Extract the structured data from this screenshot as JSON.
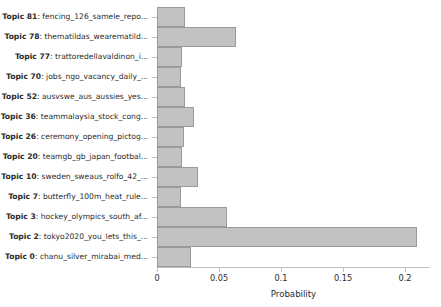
{
  "chart_data": {
    "type": "bar",
    "orientation": "horizontal",
    "title": "",
    "subtitle": "",
    "xlabel": "Probability",
    "ylabel": "",
    "xlim": [
      0,
      0.2215
    ],
    "ylim": null,
    "grid": false,
    "legend": null,
    "xticks": [
      0,
      0.05,
      0.1,
      0.15,
      0.2
    ],
    "xticklabels": [
      "0",
      "0.05",
      "0.1",
      "0.15",
      "0.2"
    ],
    "bar_color": "#c2c2c2",
    "bar_edge_color": "#9a9a9a",
    "categories": [
      "Topic 81: fencing_126_samele_repo...",
      "Topic 78: thematildas_wearematild...",
      "Topic 77: trattoredellavaldinon_i...",
      "Topic 70: jobs_ngo_vacancy_daily_...",
      "Topic 52: ausvswe_aus_aussies_yes...",
      "Topic 36: teammalaysia_stock_cong...",
      "Topic 26: ceremony_opening_pictog...",
      "Topic 20: teamgb_gb_japan_footbal...",
      "Topic 10: sweden_sweaus_rolfo_42_...",
      "Topic 7: butterfly_100m_heat_rule...",
      "Topic 3: hockey_olympics_south_af...",
      "Topic 2: tokyo2020_you_lets_this_...",
      "Topic 0: chanu_silver_mirabai_med..."
    ],
    "values": [
      0.0226,
      0.0637,
      0.0202,
      0.019,
      0.0226,
      0.0298,
      0.0218,
      0.02,
      0.033,
      0.019,
      0.0565,
      0.2097,
      0.0274
    ],
    "bars": [
      {
        "topic_number": "Topic 81",
        "topic_words": "fencing_126_samele_repo...",
        "label": "Topic 81: fencing_126_samele_repo...",
        "value": 0.0226
      },
      {
        "topic_number": "Topic 78",
        "topic_words": "thematildas_wearematild...",
        "label": "Topic 78: thematildas_wearematild...",
        "value": 0.0637
      },
      {
        "topic_number": "Topic 77",
        "topic_words": "trattoredellavaldinon_i...",
        "label": "Topic 77: trattoredellavaldinon_i...",
        "value": 0.0202
      },
      {
        "topic_number": "Topic 70",
        "topic_words": "jobs_ngo_vacancy_daily_...",
        "label": "Topic 70: jobs_ngo_vacancy_daily_...",
        "value": 0.019
      },
      {
        "topic_number": "Topic 52",
        "topic_words": "ausvswe_aus_aussies_yes...",
        "label": "Topic 52: ausvswe_aus_aussies_yes...",
        "value": 0.0226
      },
      {
        "topic_number": "Topic 36",
        "topic_words": "teammalaysia_stock_cong...",
        "label": "Topic 36: teammalaysia_stock_cong...",
        "value": 0.0298
      },
      {
        "topic_number": "Topic 26",
        "topic_words": "ceremony_opening_pictog...",
        "label": "Topic 26: ceremony_opening_pictog...",
        "value": 0.0218
      },
      {
        "topic_number": "Topic 20",
        "topic_words": "teamgb_gb_japan_footbal...",
        "label": "Topic 20: teamgb_gb_japan_footbal...",
        "value": 0.02
      },
      {
        "topic_number": "Topic 10",
        "topic_words": "sweden_sweaus_rolfo_42_...",
        "label": "Topic 10: sweden_sweaus_rolfo_42_...",
        "value": 0.033
      },
      {
        "topic_number": "Topic 7",
        "topic_words": "butterfly_100m_heat_rule...",
        "label": "Topic 7: butterfly_100m_heat_rule...",
        "value": 0.019
      },
      {
        "topic_number": "Topic 3",
        "topic_words": "hockey_olympics_south_af...",
        "label": "Topic 3: hockey_olympics_south_af...",
        "value": 0.0565
      },
      {
        "topic_number": "Topic 2",
        "topic_words": "tokyo2020_you_lets_this_...",
        "label": "Topic 2: tokyo2020_you_lets_this_...",
        "value": 0.2097
      },
      {
        "topic_number": "Topic 0",
        "topic_words": "chanu_silver_mirabai_med...",
        "label": "Topic 0: chanu_silver_mirabai_med...",
        "value": 0.0274
      }
    ]
  },
  "axis": {
    "x_title": "Probability"
  }
}
